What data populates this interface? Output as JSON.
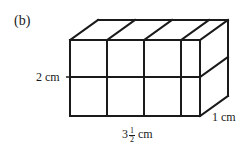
{
  "figure": {
    "part_label": "(b)",
    "shape": "rectangular prism built from unit cubes",
    "labels": {
      "height": "2 cm",
      "depth": "1 cm",
      "width_whole": "3",
      "width_num": "1",
      "width_den": "2",
      "width_unit": "cm"
    },
    "grid": {
      "columns": 3.5,
      "rows": 2,
      "depth": 1
    },
    "stroke_color": "#1a1a1a",
    "background": "#ffffff"
  }
}
